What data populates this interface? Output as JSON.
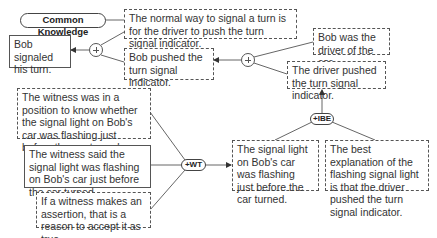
{
  "diagram": {
    "type": "argument-map",
    "nodes": {
      "common_knowledge": {
        "label": "Common Knowledge"
      },
      "normal_way": {
        "text": "The normal way to signal a turn is for the driver to push the turn signal indicator.",
        "style": "dashed"
      },
      "bob_signaled": {
        "text": "Bob signaled his turn.",
        "style": "solid"
      },
      "bob_pushed": {
        "text": "Bob pushed the turn signal indicator.",
        "style": "dashed"
      },
      "bob_driver": {
        "text": "Bob was the driver of the car.",
        "style": "dashed"
      },
      "driver_pushed": {
        "text": "The driver pushed the turn signal indicator.",
        "style": "dashed"
      },
      "ibe": {
        "label": "+IBE"
      },
      "witness_position": {
        "text": "The witness was in a position to know whether the signal light on Bob's car was flashing just before the car turned.",
        "style": "dashed"
      },
      "witness_said": {
        "text": "The witness said the signal light was flashing on Bob's car just before the car turned.",
        "style": "solid"
      },
      "wt": {
        "label": "+WT"
      },
      "witness_assertion": {
        "text": "If a witness makes an assertion, that is a reason to accept it as true.",
        "style": "dashed"
      },
      "signal_flashing": {
        "text": "The signal light on Bob's car was flashing just before the car turned.",
        "style": "dashed"
      },
      "best_explanation": {
        "text": "The best explanation of the flashing signal light is that the driver pushed the turn signal indicator.",
        "style": "dashed"
      }
    },
    "junctions": [
      {
        "id": "plus1",
        "symbol": "+",
        "inputs": [
          "normal_way",
          "bob_pushed"
        ],
        "output": "bob_signaled"
      },
      {
        "id": "plus2",
        "symbol": "+",
        "inputs": [
          "bob_driver",
          "driver_pushed"
        ],
        "output": "bob_pushed"
      },
      {
        "id": "ibe",
        "symbol": "+IBE",
        "inputs": [
          "signal_flashing",
          "best_explanation"
        ],
        "output": "driver_pushed"
      },
      {
        "id": "wt",
        "symbol": "+WT",
        "inputs": [
          "witness_position",
          "witness_said",
          "witness_assertion"
        ],
        "output": "signal_flashing"
      }
    ],
    "colors": {
      "line": "#555555",
      "text": "#333333",
      "background": "#ffffff"
    }
  }
}
